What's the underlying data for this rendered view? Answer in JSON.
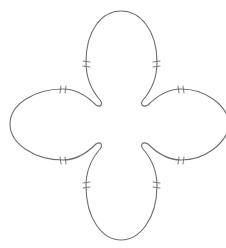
{
  "diagram": {
    "type": "closed-curve",
    "stroke_color": "#6e6e6e",
    "background_color": "#ffffff",
    "lobes": [
      {
        "name": "top",
        "tick_marks": 2
      },
      {
        "name": "right",
        "tick_marks": 2
      },
      {
        "name": "bottom",
        "tick_marks": 2
      },
      {
        "name": "left",
        "tick_marks": 2
      }
    ],
    "tick_style": "double-hash",
    "tick_count_total": 8
  }
}
